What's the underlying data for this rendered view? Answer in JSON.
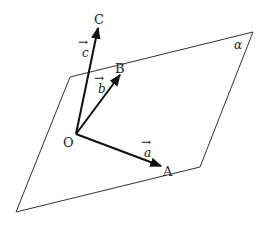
{
  "diagram": {
    "plane": {
      "label": "α",
      "vertices": [
        [
          70,
          77
        ],
        [
          253,
          32
        ],
        [
          200,
          167
        ],
        [
          16,
          212
        ]
      ],
      "stroke": "#333333"
    },
    "origin": {
      "label": "O",
      "point": [
        76,
        134
      ]
    },
    "points": {
      "A": {
        "label": "A",
        "tip": [
          162,
          166
        ]
      },
      "B": {
        "label": "B",
        "tip": [
          120,
          74
        ]
      },
      "C": {
        "label": "C",
        "tip": [
          98,
          27
        ]
      }
    },
    "vectors": {
      "a": {
        "label": "a",
        "arrow": "→"
      },
      "b": {
        "label": "b",
        "arrow": "→"
      },
      "c": {
        "label": "c",
        "arrow": "→"
      }
    },
    "stroke_color": "#111111"
  }
}
